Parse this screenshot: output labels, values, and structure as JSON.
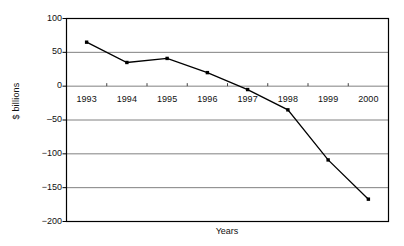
{
  "chart_data": {
    "type": "line",
    "title": "",
    "subtitle": "",
    "xlabel": "Years",
    "ylabel": "$ billions",
    "categories": [
      "1993",
      "1994",
      "1995",
      "1996",
      "1997",
      "1998",
      "1999",
      "2000"
    ],
    "series": [
      {
        "name": "",
        "values": [
          65,
          35,
          41,
          20,
          -5,
          -35,
          -109,
          -167
        ]
      }
    ],
    "ylim": [
      -200,
      100
    ],
    "yticks": [
      100,
      50,
      0,
      -50,
      -100,
      -150,
      -200
    ],
    "ytick_labels": [
      "100",
      "50",
      "0",
      "‒50",
      "−100",
      "−150",
      "−200"
    ],
    "grid": true,
    "grid_axis": "y",
    "legend": "none",
    "marker": "square",
    "marker_color": "#000000",
    "line_color": "#000000",
    "grid_color": "#808080",
    "frame_color": "#000000",
    "background": "#ffffff"
  }
}
